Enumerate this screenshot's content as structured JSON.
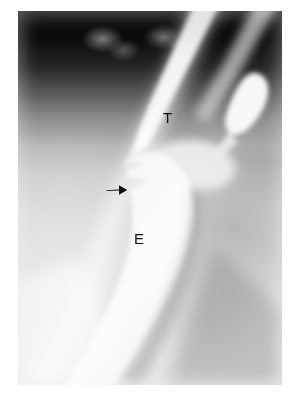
{
  "figure": {
    "kind": "radiograph",
    "modality": "contrast esophagram / barium swallow",
    "view": "lateral oblique neck and upper chest",
    "background_color": "#ffffff",
    "plate": {
      "left": 18,
      "top": 11,
      "width": 264,
      "height": 374,
      "dark_field_color": "#060606",
      "bright_contrast_color": "#fbfbfb",
      "mid_tissue_color": "#d2d2d2"
    }
  },
  "annotations": [
    {
      "id": "label-t",
      "name": "trachea-label",
      "text": "T",
      "meaning": "trachea",
      "color": "#111111",
      "x": 165,
      "y": 116
    },
    {
      "id": "label-e",
      "name": "esophagus-label",
      "text": "E",
      "meaning": "esophagus",
      "color": "#111111",
      "x": 137,
      "y": 237
    },
    {
      "id": "arrow-marker",
      "name": "fistula-arrow",
      "text": "",
      "meaning": "arrow indicating tracheoesophageal fistula / focal narrowing",
      "color": "#0d0d0d",
      "direction": "right",
      "x": 99,
      "y": 186
    }
  ],
  "structures": [
    {
      "name": "trachea-air-column",
      "label": "T",
      "description": "bright diagonal tubular air column descending from upper right"
    },
    {
      "name": "esophagus-contrast-column",
      "label": "E",
      "description": "broad contrast-filled column descending to lower left"
    },
    {
      "name": "fistulous-tract",
      "label": "",
      "description": "short communication at the arrow between the two columns"
    },
    {
      "name": "upper-bone-shadows",
      "label": "",
      "description": "two faint grey opacities in the dark upper field"
    }
  ]
}
